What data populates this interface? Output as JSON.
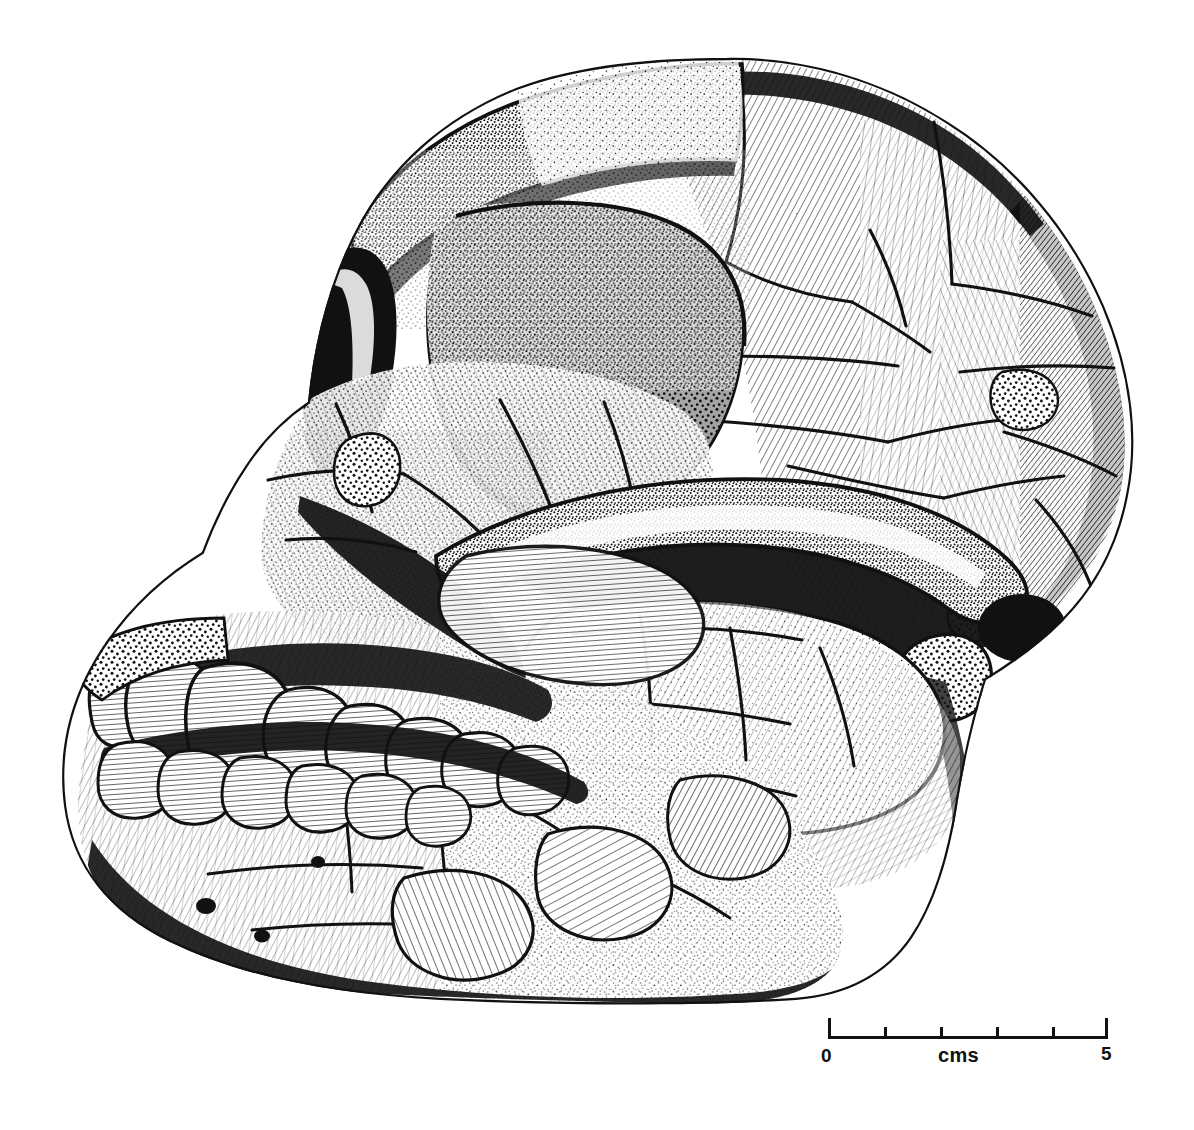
{
  "figure": {
    "kind": "scientific-illustration",
    "medium": "pen-and-ink stipple and hatch drawing",
    "background_color": "#ffffff",
    "ink_color": "#111111",
    "alt_text": "Black and white stippled pen-and-ink drawing of a fossil hominin skull in left lateral view, showing heavy brow ridge, large orbit, projecting face, full upper and lower dentition, zygomatic arch and reconstructed braincase with visible crack lines."
  },
  "scale_bar": {
    "name": "scale-bar",
    "unit_label": "cms",
    "start_label": "0",
    "end_label": "5",
    "min": 0,
    "max": 5,
    "major_ticks": [
      0,
      5
    ],
    "minor_ticks": [
      1,
      2,
      3,
      4
    ],
    "length_px": 280,
    "px_per_unit": 56,
    "color": "#111111"
  },
  "anatomy": {
    "regions": [
      "cranial vault",
      "supraorbital torus",
      "orbit",
      "nasal aperture",
      "zygomatic arch",
      "maxilla",
      "mandible",
      "temporal fossa",
      "occipital region",
      "external auditory meatus",
      "mandibular condyle"
    ],
    "teeth": [
      "incisor",
      "incisor",
      "canine",
      "premolar",
      "premolar",
      "molar",
      "molar",
      "molar"
    ]
  }
}
